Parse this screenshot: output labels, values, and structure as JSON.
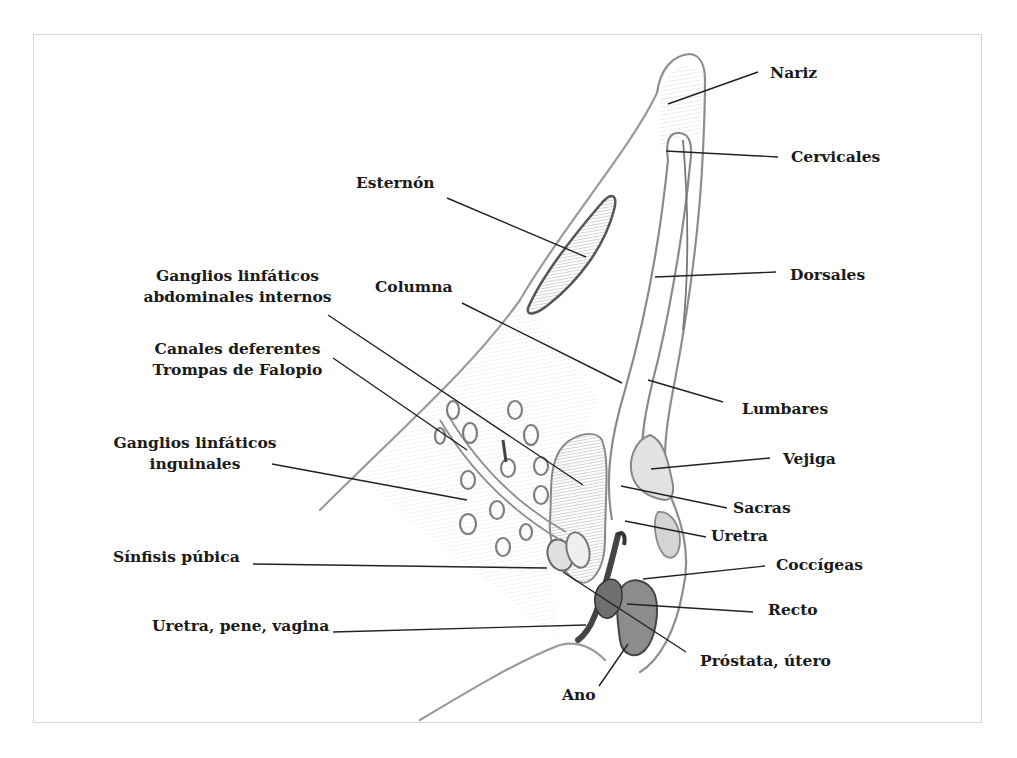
{
  "diagram": {
    "title": "",
    "labels": {
      "nariz": "Nariz",
      "cervicales": "Cervicales",
      "esternon": "Esternón",
      "dorsales": "Dorsales",
      "ganglios_abdominales_1": "Ganglios linfáticos",
      "ganglios_abdominales_2": "abdominales internos",
      "columna": "Columna",
      "canales_1": "Canales deferentes",
      "canales_2": "Trompas de Falopio",
      "lumbares": "Lumbares",
      "ganglios_inguinales_1": "Ganglios linfáticos",
      "ganglios_inguinales_2": "inguinales",
      "vejiga": "Vejiga",
      "sacras": "Sacras",
      "uretra": "Uretra",
      "sinfisis": "Sínfisis púbica",
      "coccigeas": "Coccígeas",
      "recto": "Recto",
      "uretra_pene_vagina": "Uretra, pene, vagina",
      "prostata": "Próstata, útero",
      "ano": "Ano"
    },
    "colors": {
      "outline": "#8a8a8a",
      "leader": "#222222",
      "shade_dark": "#6e6e6e",
      "shade_mid": "#b5b5b5",
      "shade_light": "#dcdcdc",
      "frame": "#d8d8d8"
    }
  }
}
